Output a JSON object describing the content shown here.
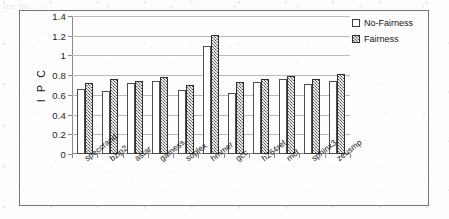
{
  "chart_data": {
    "type": "bar",
    "title": "",
    "xlabel": "",
    "ylabel": "I P C",
    "ylim": [
      0,
      1.4
    ],
    "yticks": [
      "0",
      "0.2",
      "0.4",
      "0.6",
      "0.8",
      "1",
      "1.2",
      "1.4"
    ],
    "grid": true,
    "legend_position": "top-right",
    "categories": [
      "speccrand",
      "bzip2",
      "astar",
      "gamess",
      "soplex",
      "hmmer",
      "gcc",
      "h264ref",
      "mcf",
      "sphinx3",
      "zeusmp"
    ],
    "series": [
      {
        "name": "No-Fairness",
        "values": [
          0.66,
          0.64,
          0.72,
          0.74,
          0.65,
          1.1,
          0.62,
          0.73,
          0.76,
          0.71,
          0.74
        ]
      },
      {
        "name": "Fairness",
        "values": [
          0.72,
          0.765,
          0.745,
          0.785,
          0.7,
          1.21,
          0.73,
          0.76,
          0.79,
          0.765,
          0.815
        ]
      }
    ]
  },
  "legend": {
    "entries": [
      {
        "label": "No-Fairness",
        "style": "unfilled-white"
      },
      {
        "label": "Fairness",
        "style": "hatched-gray"
      }
    ]
  },
  "colors": {
    "no_fairness_fill": "#ffffff",
    "fairness_fill": "#8f8f8f",
    "bar_outline": "#4d4d4d",
    "gridline": "#b9b9b9",
    "axis": "#8a8a8a",
    "frame": "#777777"
  },
  "background_artifacts": {
    "top_line": "the the",
    "mid_line": "",
    "bottom_line": ""
  }
}
